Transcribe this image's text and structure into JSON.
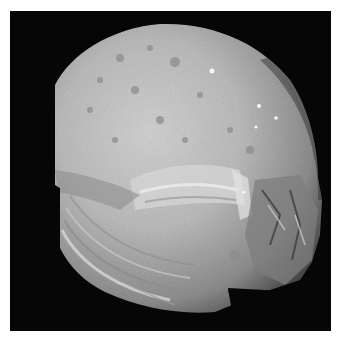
{
  "image": {
    "subject": "Grayscale spacecraft photograph of a cratered, grooved moon against black space",
    "background_color": "#060606",
    "border_color": "#ffffff",
    "surface_colors": {
      "bright": "#d8d8d8",
      "mid": "#a9a9a9",
      "dark": "#6e6e6e",
      "shadow": "#3a3a3a"
    }
  }
}
